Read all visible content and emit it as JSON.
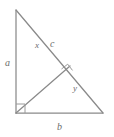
{
  "figure": {
    "background_color": "#ffffff",
    "stroke_color": "#8a8a8a",
    "label_color": "#6d6d6d",
    "labels": {
      "leg_vertical": "a",
      "leg_horizontal": "b",
      "hypotenuse_lower": "c",
      "hypotenuse_upper": "x",
      "altitude_segment": "y"
    },
    "markers": {
      "right_angle_corner": "right-angle-square",
      "right_angle_altitude": "right-angle-square"
    },
    "geometry": {
      "apex": [
        16,
        10
      ],
      "bottom_left": [
        16,
        113
      ],
      "bottom_right": [
        103,
        113
      ],
      "altitude_foot": [
        70,
        66
      ]
    }
  }
}
